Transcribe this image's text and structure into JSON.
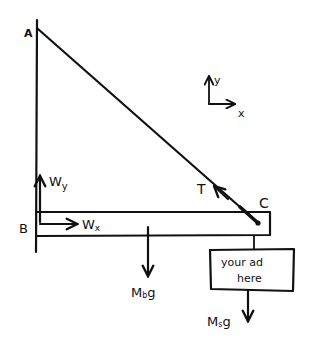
{
  "diagram": {
    "title": "",
    "points": {
      "A": "A",
      "B": "B",
      "C": "C"
    },
    "forces": {
      "tension": "T",
      "wall_y": {
        "base": "W",
        "sub": "y"
      },
      "wall_x": {
        "base": "W",
        "sub": "x"
      },
      "beam_weight": {
        "base": "M",
        "sub": "b",
        "tail": "g"
      },
      "sign_weight": {
        "base": "M",
        "sub": "s",
        "tail": "g"
      }
    },
    "axes": {
      "x": "x",
      "y": "y"
    },
    "sign": {
      "line1": "your ad",
      "line2": "here"
    },
    "colors": {
      "ink": "#111111",
      "paper": "#ffffff"
    }
  }
}
